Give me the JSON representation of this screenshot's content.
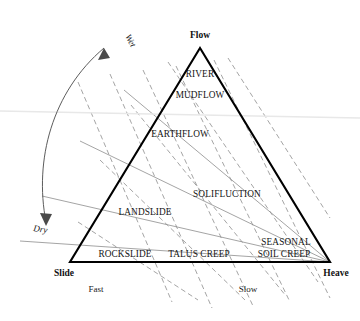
{
  "diagram": {
    "type": "ternary-classification-triangle",
    "title": "",
    "vertices": [
      {
        "id": "flow",
        "label": "Flow",
        "x": 200,
        "y": 48,
        "label_x": 200,
        "label_y": 38,
        "anchor": "middle"
      },
      {
        "id": "slide",
        "label": "Slide",
        "x": 70,
        "y": 262,
        "label_x": 64,
        "label_y": 276,
        "anchor": "middle"
      },
      {
        "id": "heave",
        "label": "Heave",
        "x": 330,
        "y": 262,
        "label_x": 335,
        "label_y": 276,
        "anchor": "middle"
      }
    ],
    "fields": [
      {
        "id": "river",
        "label": "RIVER",
        "x": 200,
        "y": 77
      },
      {
        "id": "mudflow",
        "label": "MUDFLOW",
        "x": 200,
        "y": 98
      },
      {
        "id": "earthflow",
        "label": "EARTHFLOW",
        "x": 180,
        "y": 137
      },
      {
        "id": "solifluction",
        "label": "SOLIFLUCTION",
        "x": 227,
        "y": 197
      },
      {
        "id": "landslide",
        "label": "LANDSLIDE",
        "x": 145,
        "y": 215
      },
      {
        "id": "rockslide",
        "label": "ROCKSLIDE",
        "x": 125,
        "y": 257
      },
      {
        "id": "talus-creep",
        "label": "TALUS CREEP",
        "x": 199,
        "y": 257
      },
      {
        "id": "seasonal",
        "label": "SEASONAL",
        "x": 285,
        "y": 245
      },
      {
        "id": "soil-creep",
        "label": "SOIL CREEP",
        "x": 284,
        "y": 257
      }
    ],
    "axis_labels": [
      {
        "id": "fast",
        "label": "Fast",
        "x": 96,
        "y": 292
      },
      {
        "id": "slow",
        "label": "Slow",
        "x": 248,
        "y": 292
      }
    ],
    "moisture_axis": {
      "wet_label": "Wet",
      "dry_label": "Dry",
      "wet_x": 128,
      "wet_y": 42,
      "wet_rotation": 62,
      "dry_x": 38,
      "dry_y": 230,
      "dry_rotation": 8
    },
    "colors": {
      "edge": "#000000",
      "grid": "#8d8d8d",
      "text": "#141414",
      "background": "#ffffff",
      "arrow": "#4a4a4a"
    }
  }
}
